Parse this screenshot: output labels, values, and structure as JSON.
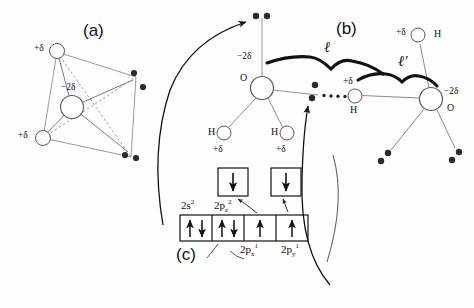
{
  "figure": {
    "type": "molecular-diagram",
    "panels": [
      {
        "id": "a",
        "tag": "(a)",
        "description": "tetrahedral water molecule with partial charges and lone pairs"
      },
      {
        "id": "b",
        "tag": "(b)",
        "description": "hydrogen bonded water dimer with bond lengths l and l-prime"
      },
      {
        "id": "c",
        "tag": "(c)",
        "description": "oxygen valence orbital box diagram"
      }
    ]
  },
  "panel_a": {
    "tag": "(a)",
    "center_charge": "−2δ",
    "center_atom_label": "O",
    "h_charges": [
      "+δ",
      "+δ"
    ],
    "lone_pair_dot_count": 4
  },
  "panel_b": {
    "tag": "(b)",
    "left_oxygen": {
      "charge": "−2δ",
      "symbol": "O"
    },
    "right_oxygen": {
      "charge": "−2δ",
      "symbol": "O"
    },
    "left_hydrogens": [
      {
        "symbol": "H",
        "charge": "+δ"
      },
      {
        "symbol": "H",
        "charge": "+δ"
      }
    ],
    "bridging_hydrogen": {
      "symbol": "H",
      "charge": "+δ"
    },
    "top_right_hydrogen": {
      "symbol": "H",
      "charge": "+δ"
    },
    "length_labels": [
      {
        "name": "covalent-bond-length",
        "text": "ℓ"
      },
      {
        "name": "hydrogen-bond-length",
        "text": "ℓ′"
      }
    ]
  },
  "panel_c": {
    "tag": "(c)",
    "top_boxes": [
      {
        "name": "promoted-box-left",
        "arrow": "down"
      },
      {
        "name": "promoted-box-right",
        "arrow": "down"
      }
    ],
    "row_labels_top": [
      "2s²",
      "2p₂²"
    ],
    "row_labels_top_parts": [
      {
        "base": "2s",
        "sup": "2",
        "sub": ""
      },
      {
        "base": "2p",
        "sup": "2",
        "sub": "z"
      }
    ],
    "row_labels_bottom_parts": [
      {
        "base": "2p",
        "sup": "1",
        "sub": "x"
      },
      {
        "base": "2p",
        "sup": "1",
        "sub": "y"
      }
    ],
    "boxes": [
      {
        "name": "orbital-box-2s",
        "spins": [
          "up",
          "down"
        ]
      },
      {
        "name": "orbital-box-2pz",
        "spins": [
          "up",
          "down"
        ]
      },
      {
        "name": "orbital-box-2px",
        "spins": [
          "up"
        ]
      },
      {
        "name": "orbital-box-2py",
        "spins": [
          "up"
        ]
      }
    ]
  },
  "colors": {
    "stroke": "#6e6e6e",
    "dark_stroke": "#111111",
    "dot": "#2b2b2b",
    "background": "#fefefe",
    "text": "#111111"
  }
}
